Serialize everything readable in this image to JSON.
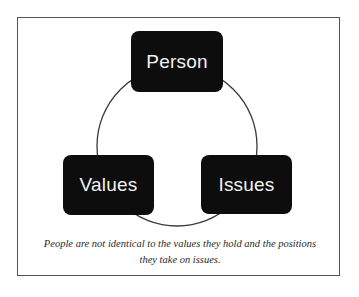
{
  "diagram": {
    "type": "cycle",
    "nodes": [
      {
        "id": "person",
        "label": "Person"
      },
      {
        "id": "values",
        "label": "Values"
      },
      {
        "id": "issues",
        "label": "Issues"
      }
    ],
    "connector": "circle",
    "caption_line1": "People are not identical to the values they hold and the positions",
    "caption_line2": "they take on issues."
  },
  "colors": {
    "node_fill": "#0d0d0d",
    "node_text": "#f2f2f2",
    "ring_stroke": "#3a3a3a",
    "frame_border": "#555555",
    "background": "#ffffff"
  }
}
